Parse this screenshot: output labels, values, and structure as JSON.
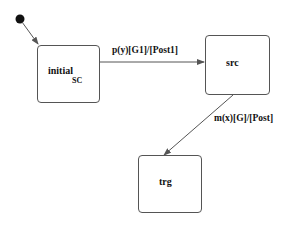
{
  "diagram": {
    "type": "state-machine",
    "initial_pseudostate": {
      "label": ""
    },
    "states": [
      {
        "id": "initial",
        "label": "initial",
        "subscript": "SC"
      },
      {
        "id": "src",
        "label": "src"
      },
      {
        "id": "trg",
        "label": "trg"
      }
    ],
    "transitions": [
      {
        "from": "initial_pseudostate",
        "to": "initial",
        "label": ""
      },
      {
        "from": "initial",
        "to": "src",
        "label": "p(y)[G1]/[Post1]"
      },
      {
        "from": "src",
        "to": "trg",
        "label": "m(x)[G]/[Post]"
      }
    ],
    "colors": {
      "line": "#555555",
      "text": "#111111",
      "pseudostate": "#111111"
    }
  }
}
